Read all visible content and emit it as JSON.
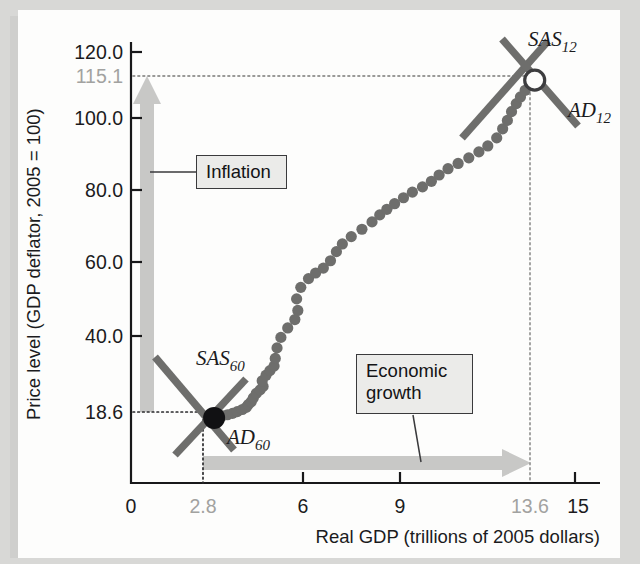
{
  "chart_data": {
    "type": "scatter",
    "title": "",
    "xlabel": "Real GDP (trillions of 2005 dollars)",
    "ylabel": "Price level (GDP deflator, 2005 = 100)",
    "xlim": [
      0,
      15.8
    ],
    "ylim": [
      0,
      126
    ],
    "grid": false,
    "legend": "none",
    "x_ticks": [
      "0",
      "2.8",
      "6",
      "9",
      "13.6",
      "15"
    ],
    "x_tick_values": [
      0,
      2.8,
      6,
      9,
      13.6,
      15
    ],
    "x_tick_muted": [
      "2.8",
      "13.6"
    ],
    "y_ticks": [
      "120.0",
      "115.1",
      "100.0",
      "80.0",
      "60.0",
      "40.0",
      "18.6"
    ],
    "y_tick_values": [
      120.0,
      115.1,
      100.0,
      80.0,
      60.0,
      40.0,
      18.6
    ],
    "y_tick_muted": [
      "115.1"
    ],
    "points": [
      [
        2.83,
        18.6
      ],
      [
        2.92,
        18.9
      ],
      [
        3.08,
        19.2
      ],
      [
        3.25,
        19.5
      ],
      [
        3.42,
        19.9
      ],
      [
        3.58,
        20.4
      ],
      [
        3.75,
        21.0
      ],
      [
        3.88,
        21.6
      ],
      [
        3.95,
        22.4
      ],
      [
        4.05,
        23.2
      ],
      [
        4.12,
        24.3
      ],
      [
        4.22,
        25.6
      ],
      [
        4.35,
        26.6
      ],
      [
        4.45,
        27.6
      ],
      [
        4.42,
        29.2
      ],
      [
        4.55,
        30.8
      ],
      [
        4.68,
        32.1
      ],
      [
        4.82,
        33.4
      ],
      [
        4.86,
        35.6
      ],
      [
        4.92,
        38.6
      ],
      [
        5.05,
        41.6
      ],
      [
        5.28,
        44.3
      ],
      [
        5.52,
        46.7
      ],
      [
        5.62,
        49.3
      ],
      [
        5.58,
        52.6
      ],
      [
        5.72,
        55.9
      ],
      [
        5.98,
        58.4
      ],
      [
        6.22,
        60.0
      ],
      [
        6.48,
        61.4
      ],
      [
        6.72,
        63.5
      ],
      [
        6.92,
        66.1
      ],
      [
        7.12,
        68.3
      ],
      [
        7.42,
        70.4
      ],
      [
        7.78,
        72.5
      ],
      [
        8.12,
        74.6
      ],
      [
        8.38,
        76.6
      ],
      [
        8.62,
        78.2
      ],
      [
        8.88,
        79.8
      ],
      [
        9.18,
        81.5
      ],
      [
        9.48,
        83.1
      ],
      [
        9.82,
        84.6
      ],
      [
        10.12,
        86.2
      ],
      [
        10.38,
        88.0
      ],
      [
        10.68,
        89.8
      ],
      [
        11.02,
        91.3
      ],
      [
        11.38,
        92.9
      ],
      [
        11.72,
        94.6
      ],
      [
        12.02,
        96.3
      ],
      [
        12.32,
        98.6
      ],
      [
        12.52,
        101.2
      ],
      [
        12.68,
        103.6
      ],
      [
        12.82,
        106.1
      ],
      [
        12.98,
        108.4
      ],
      [
        13.12,
        110.3
      ],
      [
        13.28,
        112.2
      ],
      [
        13.42,
        113.6
      ],
      [
        13.52,
        114.5
      ]
    ],
    "equilibria": [
      {
        "name": "1960 equilibrium",
        "x": 2.8,
        "y": 18.6,
        "marker": "filled-dot"
      },
      {
        "name": "2012 equilibrium",
        "x": 13.6,
        "y": 115.1,
        "marker": "open-dot"
      }
    ],
    "annotations": [
      {
        "label": "SAS",
        "sub": "60",
        "x": 4.35,
        "y": 42.5
      },
      {
        "label": "AD",
        "sub": "60",
        "x": 4.72,
        "y": 13.9
      },
      {
        "label": "SAS",
        "sub": "12",
        "x": 14.25,
        "y": 122.5
      },
      {
        "label": "AD",
        "sub": "12",
        "x": 15.1,
        "y": 101.5
      }
    ],
    "callouts": [
      {
        "text": "Inflation",
        "arrow": "vertical-up",
        "from": 18.6,
        "to": 115.1
      },
      {
        "text": "Economic growth",
        "arrow": "horizontal-right",
        "from": 2.8,
        "to": 13.6
      }
    ]
  },
  "labels": {
    "y_axis_title": "Price level (GDP deflator, 2005 = 100)",
    "x_axis_title": "Real GDP (trillions of 2005 dollars)",
    "y_120": "120.0",
    "y_115": "115.1",
    "y_100": "100.0",
    "y_80": "80.0",
    "y_60": "60.0",
    "y_40": "40.0",
    "y_18": "18.6",
    "x_0": "0",
    "x_28": "2.8",
    "x_6": "6",
    "x_9": "9",
    "x_136": "13.6",
    "x_15": "15",
    "sas60": "SAS",
    "sas60_sub": "60",
    "ad60": "AD",
    "ad60_sub": "60",
    "sas12": "SAS",
    "sas12_sub": "12",
    "ad12": "AD",
    "ad12_sub": "12",
    "inflation": "Inflation",
    "growth_line1": "Economic",
    "growth_line2": "growth"
  },
  "colors": {
    "page_background": "#d8d8d6",
    "sheet": "#fdfdfc",
    "axis": "#18181a",
    "dot_series": "#6e6e6c",
    "cross_line": "#6e6e6c",
    "block_arrow": "#c8c8c6",
    "callout_fill": "#ebebe9",
    "callout_border": "#3a3a3c",
    "muted_text": "#a2a2a0",
    "text": "#1b1b1d"
  }
}
